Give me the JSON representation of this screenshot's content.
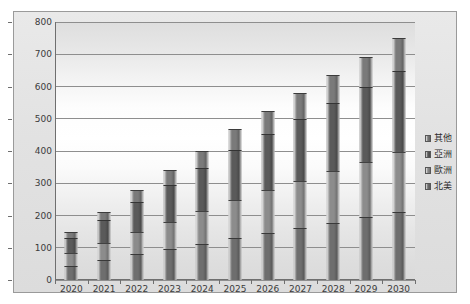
{
  "chart_data": {
    "type": "bar",
    "subtype": "stacked-column-3d",
    "title": "",
    "xlabel": "",
    "ylabel": "",
    "ylim": [
      0,
      800
    ],
    "ytick_step": 100,
    "yticks": [
      "800",
      "700",
      "600",
      "500",
      "400",
      "300",
      "200",
      "100",
      "0"
    ],
    "grid": true,
    "legend_position": "right",
    "categories": [
      "2020",
      "2021",
      "2022",
      "2023",
      "2024",
      "2025",
      "2026",
      "2027",
      "2028",
      "2029",
      "2030"
    ],
    "series": [
      {
        "name": "北美",
        "color": "#6e6e6e",
        "values": [
          45,
          62,
          80,
          96,
          113,
          131,
          147,
          162,
          178,
          194,
          210
        ]
      },
      {
        "name": "歐洲",
        "color": "#8c8c8c",
        "values": [
          38,
          53,
          70,
          85,
          100,
          117,
          131,
          145,
          159,
          173,
          188
        ]
      },
      {
        "name": "亞洲",
        "color": "#5a5a5a",
        "values": [
          48,
          70,
          93,
          113,
          133,
          155,
          175,
          193,
          212,
          231,
          250
        ]
      },
      {
        "name": "其他",
        "color": "#7a7a7a",
        "values": [
          19,
          27,
          37,
          46,
          54,
          64,
          72,
          80,
          86,
          94,
          102
        ]
      }
    ],
    "totals": [
      150,
      212,
      280,
      340,
      400,
      467,
      525,
      580,
      635,
      692,
      750
    ],
    "legend": [
      {
        "label": "其他",
        "color": "#7a7a7a"
      },
      {
        "label": "亞洲",
        "color": "#5a5a5a"
      },
      {
        "label": "歐洲",
        "color": "#8c8c8c"
      },
      {
        "label": "北美",
        "color": "#6e6e6e"
      }
    ]
  }
}
